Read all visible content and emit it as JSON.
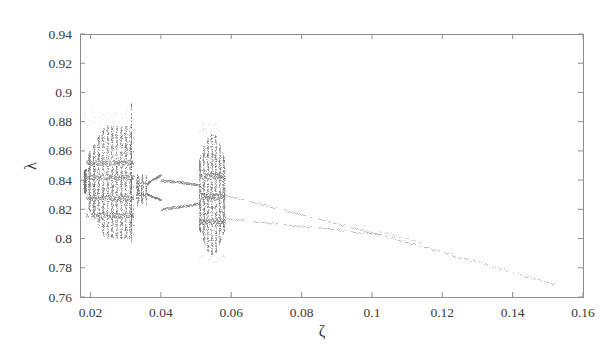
{
  "figure": {
    "background_color": "#fefefe",
    "frame_color": "#8f8f8f",
    "point_color": "#6e6e6e"
  },
  "axes": {
    "x_title": "ζ",
    "y_title": "λ",
    "x_ticks": [
      "0.02",
      "0.04",
      "0.06",
      "0.08",
      "0.1",
      "0.12",
      "0.14",
      "0.16"
    ],
    "y_ticks": [
      "0.76",
      "0.78",
      "0.8",
      "0.82",
      "0.84",
      "0.86",
      "0.88",
      "0.9",
      "0.92",
      "0.94"
    ]
  },
  "chart_data": {
    "type": "scatter",
    "title": "",
    "xlabel": "ζ",
    "ylabel": "λ",
    "xlim": [
      0.017,
      0.16
    ],
    "ylim": [
      0.76,
      0.94
    ],
    "xticks": [
      0.02,
      0.04,
      0.06,
      0.08,
      0.1,
      0.12,
      0.14,
      0.16
    ],
    "yticks": [
      0.76,
      0.78,
      0.8,
      0.82,
      0.84,
      0.86,
      0.88,
      0.9,
      0.92,
      0.94
    ],
    "grid": false,
    "legend": null,
    "regions": [
      {
        "name": "chaotic-band-1",
        "x_range": [
          0.018,
          0.0322
        ],
        "lambda_range": [
          0.799,
          0.879
        ],
        "character": "dense vertical striping, alternating chaotic and narrow periodic windows",
        "stripe_count": 22
      },
      {
        "name": "isolated-spike",
        "x_range": [
          0.0313,
          0.0318
        ],
        "lambda_range": [
          0.796,
          0.893
        ],
        "character": "single tall narrow vertical spike reaching lambda 0.893"
      },
      {
        "name": "periodic-window-fan",
        "x_range": [
          0.033,
          0.04
        ],
        "lambda_range": [
          0.82,
          0.842
        ],
        "character": "period-doubling fan, a few short vertical bands then two diverging branches"
      },
      {
        "name": "period-2-branches-a",
        "x_range": [
          0.04,
          0.051
        ],
        "lambda_range": [
          0.81,
          0.84
        ],
        "character": "two smooth dotted branches, upper near 0.838 decaying, lower near 0.822 decaying"
      },
      {
        "name": "chaotic-band-2",
        "x_range": [
          0.0508,
          0.0582
        ],
        "lambda_range": [
          0.788,
          0.873
        ],
        "character": "dense vertical striping, narrower than first band",
        "stripe_count": 13
      },
      {
        "name": "period-2-branches-b",
        "x_range": [
          0.0582,
          0.102
        ],
        "lambda_range": [
          0.805,
          0.83
        ],
        "character": "two dotted branches slowly converging toward each other"
      },
      {
        "name": "merged-branch",
        "x_range": [
          0.102,
          0.152
        ],
        "lambda_range": [
          0.77,
          0.806
        ],
        "character": "single dotted branch decaying almost linearly to lambda 0.770"
      }
    ],
    "series": [
      {
        "name": "upper-branch",
        "x": [
          0.04,
          0.045,
          0.05,
          0.058,
          0.065,
          0.072,
          0.08,
          0.088,
          0.095,
          0.102,
          0.11,
          0.12,
          0.13,
          0.14,
          0.152
        ],
        "y": [
          0.84,
          0.8385,
          0.837,
          0.83,
          0.825,
          0.82,
          0.815,
          0.81,
          0.806,
          0.803,
          0.7975,
          0.79,
          0.783,
          0.776,
          0.77
        ]
      },
      {
        "name": "lower-branch",
        "x": [
          0.04,
          0.045,
          0.05,
          0.058,
          0.065,
          0.072,
          0.08,
          0.088,
          0.095,
          0.102
        ],
        "y": [
          0.82,
          0.8225,
          0.824,
          0.814,
          0.812,
          0.8095,
          0.807,
          0.8048,
          0.8035,
          0.803
        ]
      }
    ]
  }
}
